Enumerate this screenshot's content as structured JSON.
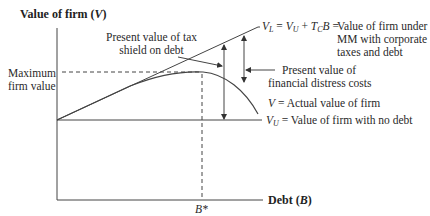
{
  "diagram": {
    "y_axis_label": "Value of firm (V)",
    "x_axis_label": "Debt (B)",
    "max_label_line1": "Maximum",
    "max_label_line2": "firm value",
    "b_star": "B*",
    "tax_shield_line1": "Present value of tax",
    "tax_shield_line2": "shield on debt",
    "distress_line1": "Present value of",
    "distress_line2": "financial distress costs",
    "vl_equation": "V_L = V_U + T_C B =",
    "vl_desc_line1": "Value of firm under",
    "vl_desc_line2": "MM with corporate",
    "vl_desc_line3": "taxes and debt",
    "v_actual": "V = Actual value of firm",
    "vu_label": "V_U = Value of firm with no debt",
    "colors": {
      "line": "#333333",
      "text": "#2a2a2a",
      "background": "#ffffff"
    }
  }
}
